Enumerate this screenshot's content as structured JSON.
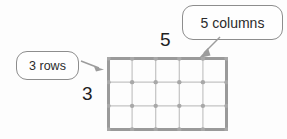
{
  "figure": {
    "type": "array-model-diagram",
    "background_color": "#fdfdfd"
  },
  "callouts": [
    {
      "id": "rows",
      "text": "3 rows",
      "border_color": "#8d8d8d",
      "fill_color": "#fefefe",
      "arrow_direction": "right"
    },
    {
      "id": "columns",
      "text": "5 columns",
      "border_color": "#8d8d8d",
      "fill_color": "#fefefe",
      "arrow_direction": "down-left"
    }
  ],
  "dimension_labels": {
    "columns_number": "5",
    "rows_number": "3",
    "text_color": "#1f1f1f"
  },
  "chart_data": {
    "type": "table",
    "title": "",
    "rows": 3,
    "columns": 5,
    "total_dots": 24,
    "grid_nodes_x": 6,
    "grid_nodes_y": 4,
    "outer_border_color": "#9a9a9a",
    "inner_line_color": "#c3c3c3",
    "node_color": "#a8a8a8",
    "xlabel": "5",
    "ylabel": "3"
  },
  "colors": {
    "outline": "#8d8d8d",
    "grid_outer": "#9a9a9a",
    "grid_inner": "#c3c3c3",
    "node": "#a8a8a8",
    "arrow": "#9c9c9c",
    "text": "#2b2b2b"
  }
}
